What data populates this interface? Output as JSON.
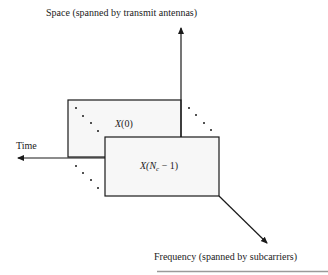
{
  "axes": {
    "space_label": "Space (spanned by transmit antennas)",
    "time_label": "Time",
    "frequency_label": "Frequency (spanned by subcarriers)"
  },
  "blocks": {
    "first": {
      "label_prefix": "X",
      "label_arg": "(0)"
    },
    "last": {
      "label_prefix": "X(N",
      "label_sub": "c",
      "label_suffix": " − 1)"
    }
  },
  "colors": {
    "stroke": "#1a1a1a",
    "block_fill": "#f7f7f7",
    "bottom_rule": "#9a9a9a"
  }
}
